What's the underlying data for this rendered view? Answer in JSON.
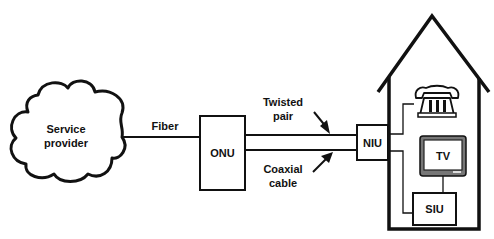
{
  "diagram": {
    "type": "network-topology",
    "nodes": {
      "service_provider": {
        "label_line1": "Service",
        "label_line2": "provider",
        "shape": "cloud"
      },
      "onu": {
        "label": "ONU",
        "shape": "box"
      },
      "niu": {
        "label": "NIU",
        "shape": "box"
      },
      "tv": {
        "label": "TV",
        "shape": "television"
      },
      "siu": {
        "label": "SIU",
        "shape": "box"
      },
      "telephone": {
        "icon": "telephone-icon"
      },
      "house": {
        "icon": "house-outline"
      }
    },
    "links": {
      "fiber": {
        "label": "Fiber",
        "from": "Service provider",
        "to": "ONU"
      },
      "twisted_pair": {
        "label_line1": "Twisted",
        "label_line2": "pair",
        "from": "ONU",
        "to": "NIU"
      },
      "coaxial": {
        "label_line1": "Coaxial",
        "label_line2": "cable",
        "from": "ONU",
        "to": "NIU"
      }
    },
    "colors": {
      "stroke": "#111111",
      "background": "#ffffff",
      "tv_screen_frame": "#888888"
    }
  }
}
